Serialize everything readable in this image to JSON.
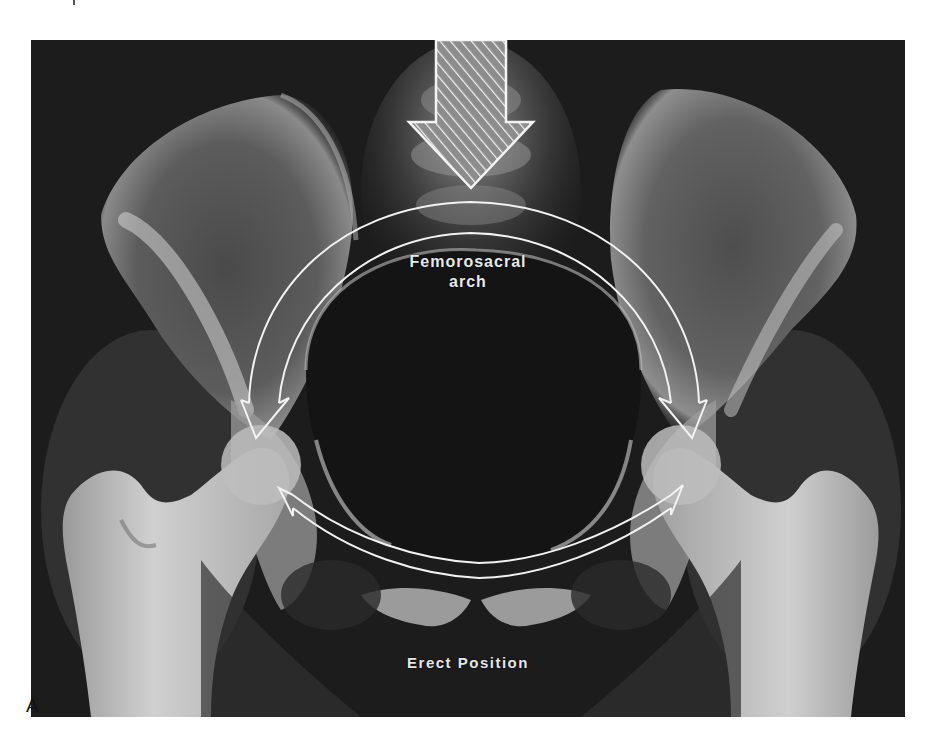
{
  "figure": {
    "panel_letter": "A",
    "labels": {
      "arch_line1": "Femorosacral",
      "arch_line2": "arch",
      "position": "Erect Position"
    },
    "annotations": {
      "load_arrow": "downward-hatched-arrow",
      "arch_arrows": "curved-double-line-arrows-left-and-right",
      "lower_arrow": "curved-double-headed-arrow-across-pubis"
    },
    "colors": {
      "page_background": "#ffffff",
      "film_background": "#1a1a1a",
      "bone_highlight": "#d9d9d9",
      "annotation_stroke": "#f2f2f2",
      "label_text": "#e8e8e8",
      "panel_letter": "#111111"
    }
  }
}
